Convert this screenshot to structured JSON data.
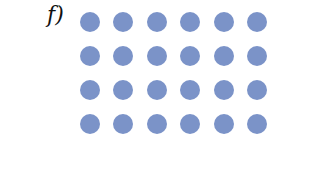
{
  "label": "f)",
  "dots": {
    "rows": 4,
    "cols": 6,
    "total": 24,
    "color": "#7b93c8"
  }
}
